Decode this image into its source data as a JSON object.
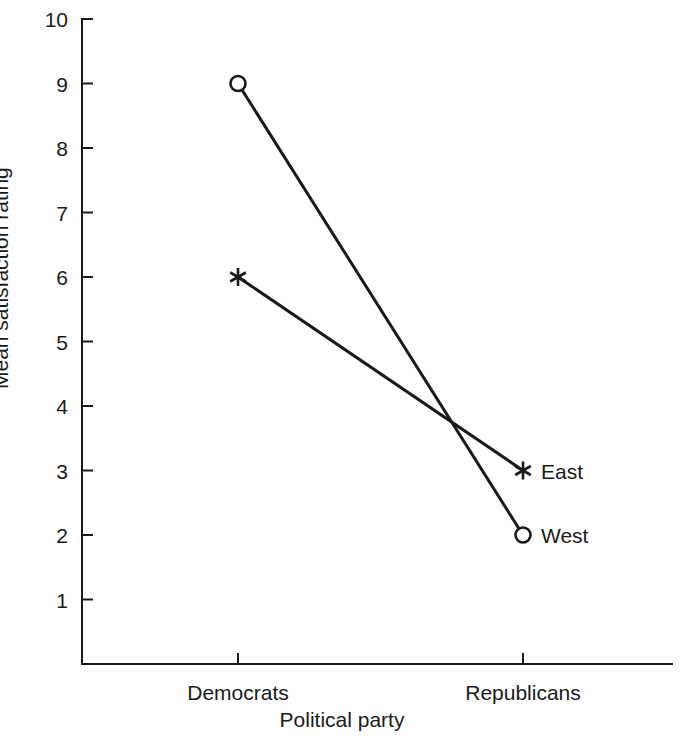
{
  "chart_data": {
    "type": "line",
    "title": "",
    "subtitle": "",
    "xlabel": "Political party",
    "ylabel": "Mean satisfaction rating",
    "categories": [
      "Democrats",
      "Republicans"
    ],
    "series": [
      {
        "name": "East",
        "values": [
          6,
          3
        ],
        "marker": "star"
      },
      {
        "name": "West",
        "values": [
          9,
          2
        ],
        "marker": "open-circle"
      }
    ],
    "yticks": [
      1,
      2,
      3,
      4,
      5,
      6,
      7,
      8,
      9,
      10
    ],
    "ylim": [
      0,
      10
    ],
    "grid": false,
    "legend_position": "inline-right-of-last-point",
    "annotations": [
      {
        "text": "East",
        "series": "East",
        "at_category": "Republicans"
      },
      {
        "text": "West",
        "series": "West",
        "at_category": "Republicans"
      }
    ],
    "line_color": "#1a1a1a",
    "background_color": "#ffffff"
  }
}
